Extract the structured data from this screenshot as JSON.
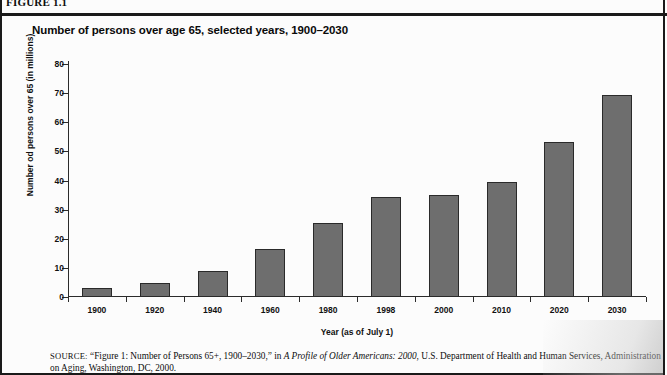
{
  "figure": {
    "label": "FIGURE 1.1",
    "title": "Number of persons over age 65, selected years, 1900–2030"
  },
  "source": {
    "prefix": "SOURCE:",
    "line1_a": " “Figure 1: Number of Persons 65+, 1900–2030,” in ",
    "line1_italic": "A Profile of Older Americans: 2000",
    "line1_b": ", U.S. Department of Health and Human Services,",
    "line2": "Administration on Aging, Washington, DC, 2000."
  },
  "chart_data": {
    "type": "bar",
    "title": "Number of persons over age 65, selected years, 1900–2030",
    "xlabel": "Year (as of July 1)",
    "ylabel": "Number od persons over 65 (in millions)",
    "categories": [
      "1900",
      "1920",
      "1940",
      "1960",
      "1980",
      "1998",
      "2000",
      "2010",
      "2020",
      "2030"
    ],
    "values": [
      3.1,
      4.9,
      9.0,
      16.6,
      25.5,
      34.4,
      35.0,
      39.4,
      53.2,
      69.4
    ],
    "ylim": [
      0,
      80
    ],
    "yticks": [
      0,
      10,
      20,
      30,
      40,
      50,
      60,
      70,
      80
    ],
    "ytick_labels": [
      "0",
      "10",
      "20",
      "30",
      "40",
      "50",
      "60",
      "70",
      "80"
    ],
    "grid": false,
    "legend": false,
    "bar_color": "#6e6e6e",
    "bar_edge_color": "#2a2a2a",
    "axis_color": "#2b2b2b"
  }
}
